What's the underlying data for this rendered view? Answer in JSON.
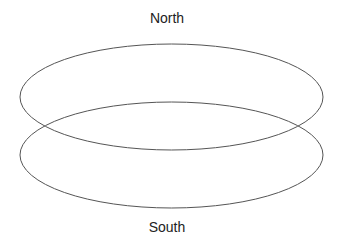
{
  "diagram": {
    "labels": {
      "top": "North",
      "bottom": "South"
    },
    "shapes": [
      {
        "type": "ellipse",
        "name": "upper-ring",
        "cx": 171.5,
        "cy": 97,
        "rx": 151.5,
        "ry": 53
      },
      {
        "type": "ellipse",
        "name": "lower-ring",
        "cx": 171.5,
        "cy": 155,
        "rx": 151.5,
        "ry": 53
      }
    ],
    "stroke_color": "#555555"
  }
}
